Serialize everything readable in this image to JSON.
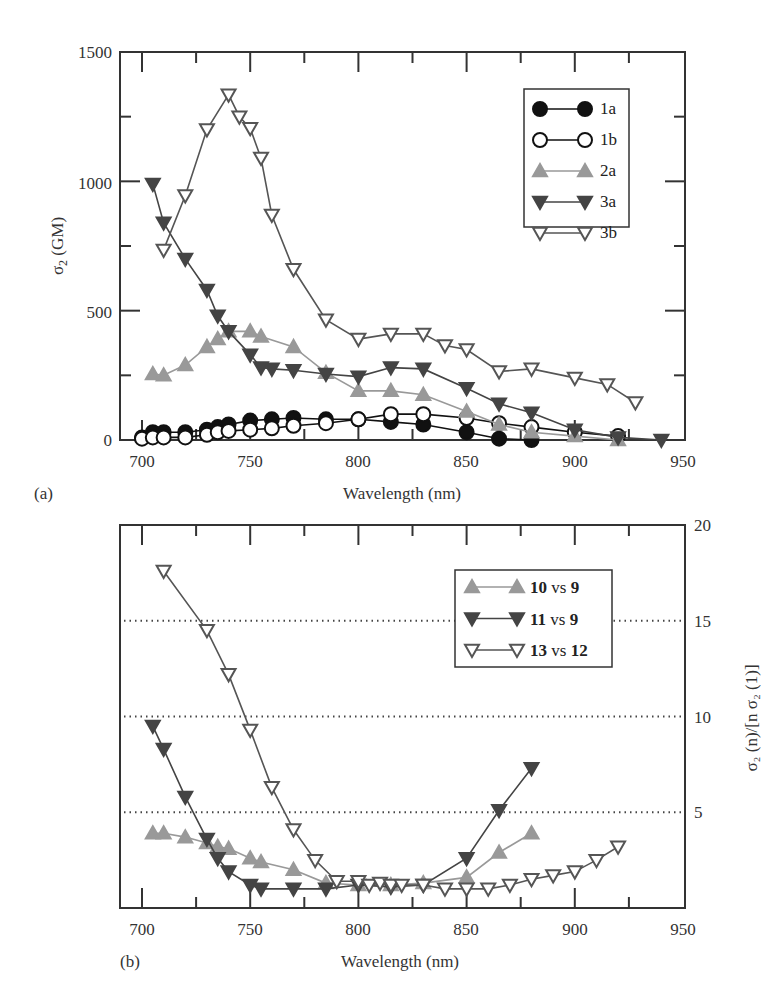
{
  "chart_data": [
    {
      "panel": "(a)",
      "type": "line",
      "title": "",
      "xlabel": "Wavelength (nm)",
      "ylabel": "σ2 (GM)",
      "xlim": [
        690,
        950
      ],
      "ylim": [
        0,
        1500
      ],
      "xticks": [
        700,
        750,
        800,
        850,
        900,
        950
      ],
      "yticks": [
        0,
        500,
        1000,
        1500
      ],
      "grid": false,
      "legend_position": "upper right",
      "series": [
        {
          "name": "1a",
          "marker": "filled-circle",
          "color": "#111111",
          "x": [
            700,
            705,
            710,
            720,
            730,
            735,
            740,
            750,
            760,
            770,
            785,
            800,
            815,
            830,
            850,
            865,
            880
          ],
          "y": [
            10,
            30,
            30,
            30,
            40,
            50,
            60,
            75,
            80,
            85,
            80,
            80,
            70,
            60,
            30,
            5,
            0
          ]
        },
        {
          "name": "1b",
          "marker": "open-circle",
          "color": "#111111",
          "x": [
            700,
            705,
            710,
            720,
            730,
            735,
            740,
            750,
            760,
            770,
            785,
            800,
            815,
            830,
            850,
            865,
            880,
            900,
            920
          ],
          "y": [
            5,
            10,
            10,
            10,
            20,
            30,
            35,
            40,
            45,
            55,
            65,
            80,
            100,
            100,
            85,
            65,
            50,
            30,
            15
          ]
        },
        {
          "name": "2a",
          "marker": "filled-triangle-up",
          "color": "#999999",
          "x": [
            705,
            710,
            720,
            730,
            735,
            740,
            750,
            755,
            770,
            785,
            800,
            815,
            830,
            850,
            865,
            880,
            900,
            920
          ],
          "y": [
            255,
            250,
            290,
            360,
            390,
            420,
            420,
            400,
            360,
            260,
            190,
            190,
            175,
            110,
            60,
            30,
            15,
            0
          ]
        },
        {
          "name": "3a",
          "marker": "filled-triangle-down",
          "color": "#444444",
          "x": [
            705,
            710,
            720,
            730,
            735,
            740,
            750,
            755,
            760,
            770,
            785,
            800,
            815,
            830,
            850,
            865,
            880,
            900,
            920,
            940
          ],
          "y": [
            990,
            840,
            700,
            580,
            480,
            420,
            330,
            280,
            275,
            270,
            255,
            245,
            280,
            275,
            200,
            140,
            105,
            40,
            10,
            0
          ]
        },
        {
          "name": "3b",
          "marker": "open-triangle-down",
          "color": "#555555",
          "x": [
            710,
            720,
            730,
            740,
            745,
            750,
            755,
            760,
            770,
            785,
            800,
            815,
            830,
            840,
            850,
            865,
            880,
            900,
            915,
            928
          ],
          "y": [
            735,
            945,
            1200,
            1335,
            1250,
            1205,
            1090,
            870,
            660,
            465,
            390,
            410,
            410,
            365,
            350,
            265,
            275,
            240,
            215,
            145
          ]
        }
      ]
    },
    {
      "panel": "(b)",
      "type": "line",
      "title": "",
      "xlabel": "Wavelength (nm)",
      "ylabel": "σ2 (n)/[n σ2 (1)]",
      "y_axis_side": "right",
      "xlim": [
        690,
        950
      ],
      "ylim": [
        0,
        20
      ],
      "xticks": [
        700,
        750,
        800,
        850,
        900,
        950
      ],
      "yticks": [
        5,
        10,
        15,
        20
      ],
      "grid": "dotted horizontal at 5, 10, 15",
      "legend_position": "upper right",
      "series": [
        {
          "name": "10 vs 9",
          "marker": "filled-triangle-up",
          "color": "#999999",
          "x": [
            705,
            710,
            720,
            730,
            735,
            740,
            750,
            755,
            770,
            785,
            800,
            815,
            830,
            850,
            865,
            880
          ],
          "y": [
            3.9,
            3.9,
            3.7,
            3.4,
            3.2,
            3.1,
            2.6,
            2.4,
            2.0,
            1.3,
            1.2,
            1.2,
            1.3,
            1.6,
            2.9,
            3.9
          ]
        },
        {
          "name": "11 vs 9",
          "marker": "filled-triangle-down",
          "color": "#444444",
          "x": [
            705,
            710,
            720,
            730,
            735,
            740,
            750,
            755,
            770,
            785,
            800,
            815,
            830,
            850,
            865,
            880
          ],
          "y": [
            9.5,
            8.3,
            5.8,
            3.6,
            2.6,
            1.9,
            1.2,
            1.0,
            1.0,
            1.0,
            1.2,
            1.1,
            1.2,
            2.6,
            5.1,
            7.3
          ]
        },
        {
          "name": "13 vs 12",
          "marker": "open-triangle-down",
          "color": "#555555",
          "x": [
            710,
            730,
            740,
            750,
            760,
            770,
            780,
            790,
            800,
            805,
            810,
            815,
            820,
            830,
            840,
            850,
            860,
            870,
            880,
            890,
            900,
            910,
            920
          ],
          "y": [
            17.6,
            14.5,
            12.2,
            9.3,
            6.3,
            4.1,
            2.5,
            1.4,
            1.4,
            1.2,
            1.3,
            1.2,
            1.2,
            1.2,
            1.0,
            1.0,
            1.0,
            1.2,
            1.5,
            1.7,
            1.9,
            2.5,
            3.2
          ]
        }
      ]
    }
  ],
  "panel_a": {
    "label": "(a)",
    "xlabel": "Wavelength (nm)",
    "ylabel_main": "σ",
    "ylabel_sub": "2",
    "ylabel_rest": " (GM)",
    "xtick_labels": [
      "700",
      "750",
      "800",
      "850",
      "900",
      "950"
    ],
    "ytick_labels": [
      "0",
      "500",
      "1000",
      "1500"
    ],
    "legend": [
      "1a",
      "1b",
      "2a",
      "3a",
      "3b"
    ]
  },
  "panel_b": {
    "label": "(b)",
    "xlabel": "Wavelength (nm)",
    "ylabel": "σ₂ (n)/[n σ₂ (1)]",
    "xtick_labels": [
      "700",
      "750",
      "800",
      "850",
      "900",
      "950"
    ],
    "ytick_labels": [
      "5",
      "10",
      "15",
      "20"
    ],
    "legend": [
      {
        "num_a": "10",
        "vs": "vs",
        "num_b": "9"
      },
      {
        "num_a": "11",
        "vs": "vs",
        "num_b": "9"
      },
      {
        "num_a": "13",
        "vs": "vs",
        "num_b": "12"
      }
    ]
  }
}
